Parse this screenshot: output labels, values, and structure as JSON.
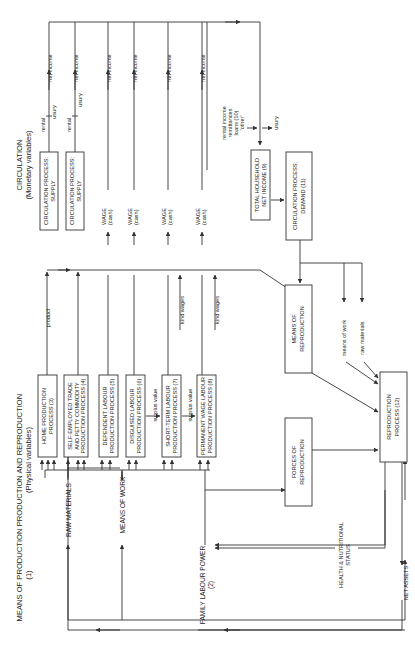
{
  "diagram": {
    "orientation": "rotated 90 degrees counterclockwise",
    "headers": {
      "means_of_production": [
        "MEANS OF PRODUCTION",
        "(1)"
      ],
      "production_reproduction": [
        "PRODUCTION AND REPRODUCTION",
        "(Physical variables)"
      ],
      "circulation": [
        "CIRCULATION",
        "(Monetary variables)"
      ]
    },
    "inputs": {
      "raw_materials": "RAW MATERIALS",
      "means_of_work": "MEANS OF WORK",
      "family_labour_power": [
        "FAMILY LABOUR POWER",
        "(2)"
      ]
    },
    "production_processes": [
      {
        "lines": [
          "HOME PRODUCTION",
          "PROCESS (3)"
        ]
      },
      {
        "lines": [
          "SELF-EMPLOYED TRADE",
          "AND PETTY COMMODITY",
          "PRODUCTION PROCESS (4)"
        ]
      },
      {
        "lines": [
          "DEPENDENT LABOUR",
          "PRODUCTION PROCESS (5)"
        ]
      },
      {
        "lines": [
          "DISGUISED LABOUR",
          "PRODUCTION PROCESS (6)"
        ]
      },
      {
        "lines": [
          "SHORT-TERM LABOUR",
          "PRODUCTION PROCESS (7)"
        ]
      },
      {
        "lines": [
          "PERMANENT WAGE LABOUR",
          "PRODUCTION PROCESS (8)"
        ]
      }
    ],
    "flow_labels": {
      "product": "product",
      "surplus_value": "surplus value",
      "kind_wages": "kind wages",
      "net_income": "net income",
      "rental": "rental",
      "usury": "usury",
      "means_of_work_lc": "means of work",
      "raw_materials_lc": "raw materials",
      "other_income": [
        "rental income",
        "remittances",
        "loans (10)",
        "'other'"
      ]
    },
    "circulation_boxes": [
      {
        "lines": [
          "CIRCULATION PROCESS:",
          "SUPPLY"
        ]
      },
      {
        "lines": [
          "CIRCULATION PROCESS:",
          "SUPPLY"
        ]
      }
    ],
    "wage_labels": [
      [
        "WAGE",
        "(cash)"
      ],
      [
        "WAGE",
        "(cash)"
      ],
      [
        "WAGE",
        "(cash)"
      ],
      [
        "WAGE",
        "(cash)"
      ]
    ],
    "household_income": [
      "TOTAL HOUSEHOLD",
      "NET INCOME (9)"
    ],
    "demand": [
      "CIRCULATION PROCESS:",
      "DEMAND (11)"
    ],
    "means_of_reproduction": [
      "MEANS OF",
      "REPRODUCTION"
    ],
    "forces_of_reproduction": [
      "FORCES OF",
      "REPRODUCTION"
    ],
    "reproduction_process": [
      "REPRODUCTION",
      "PROCESS (12)"
    ],
    "health_status": [
      "HEALTH & NUTRITIONAL",
      "STATUS"
    ],
    "net_assets": "NET ASSETS"
  }
}
